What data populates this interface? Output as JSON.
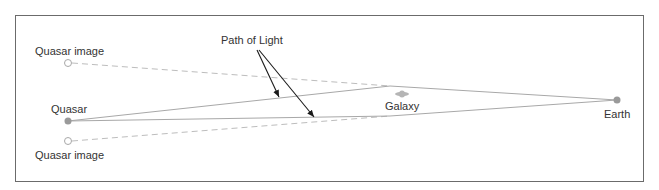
{
  "diagram": {
    "labels": {
      "quasar_image_top": "Quasar image",
      "quasar": "Quasar",
      "quasar_image_bottom": "Quasar image",
      "path_of_light": "Path of Light",
      "galaxy": "Galaxy",
      "earth": "Earth"
    },
    "colors": {
      "frame": "#6b6b6b",
      "light_path": "#a8a8a8",
      "apparent_path_dashed": "#bdbdbd",
      "object_fill": "#9a9a9a",
      "arrow": "#1a1a1a",
      "text": "#333333"
    },
    "nodes": [
      {
        "id": "quasar_image_top",
        "x": 68,
        "y": 63,
        "style": "hollow"
      },
      {
        "id": "quasar",
        "x": 68,
        "y": 121,
        "style": "filled"
      },
      {
        "id": "quasar_image_bottom",
        "x": 68,
        "y": 141,
        "style": "hollow"
      },
      {
        "id": "galaxy",
        "x": 402,
        "y": 94,
        "style": "diamond"
      },
      {
        "id": "earth",
        "x": 617,
        "y": 100,
        "style": "filled"
      }
    ],
    "paths": [
      {
        "from": "quasar",
        "via": [
          390,
          86
        ],
        "to": "earth",
        "style": "solid"
      },
      {
        "from": "quasar",
        "via": [
          390,
          116
        ],
        "to": "earth",
        "style": "solid"
      },
      {
        "from": "quasar_image_top",
        "to": [
          390,
          86
        ],
        "style": "dashed"
      },
      {
        "from": "quasar_image_bottom",
        "to": [
          390,
          116
        ],
        "style": "dashed"
      }
    ],
    "annotations": [
      {
        "label": "path_of_light",
        "arrows_to": [
          [
            279,
            97
          ],
          [
            314,
            117
          ]
        ]
      }
    ]
  }
}
